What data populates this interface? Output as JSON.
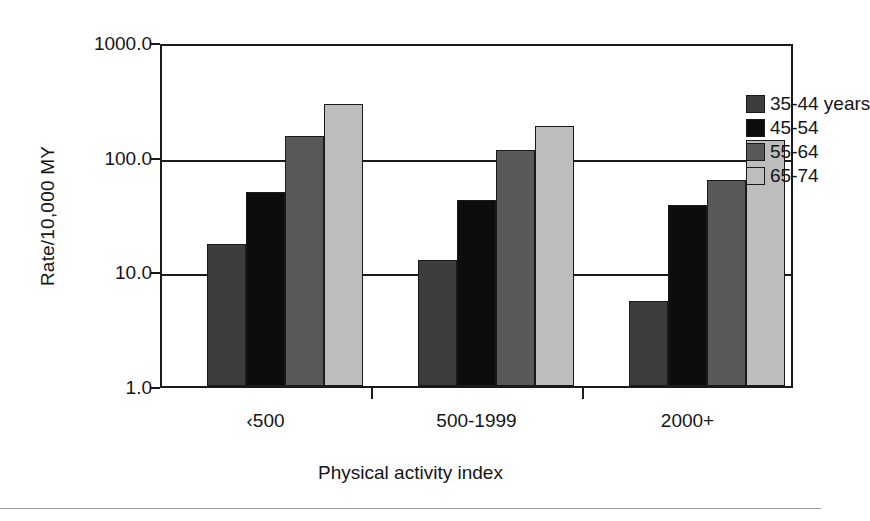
{
  "chart_data": {
    "type": "bar",
    "title": "",
    "subtitle": "",
    "xlabel": "Physical activity index",
    "ylabel": "Rate/10,000 MY",
    "yscale": "log",
    "ylim": [
      1.0,
      1000.0
    ],
    "ytick_labels": [
      "1000.0",
      "100.0",
      "10.0",
      "1.0"
    ],
    "ytick_values": [
      1000.0,
      100.0,
      10.0,
      1.0
    ],
    "grid": true,
    "grid_axis": "y",
    "legend_position": "top-right",
    "categories": [
      "‹500",
      "500-1999",
      "2000+"
    ],
    "series": [
      {
        "name": "35-44 years",
        "color": "#3d3d3d",
        "values": [
          17.3,
          12.6,
          5.5
        ]
      },
      {
        "name": "45-54",
        "color": "#0d0d0d",
        "values": [
          49.0,
          42.0,
          38.0
        ]
      },
      {
        "name": "55-64",
        "color": "#595959",
        "values": [
          152.0,
          115.0,
          62.0
        ]
      },
      {
        "name": "65-74",
        "color": "#bdbdbd",
        "values": [
          288.0,
          184.0,
          140.0
        ]
      }
    ]
  },
  "legend": {
    "items": [
      {
        "label": "35-44 years",
        "color": "#3d3d3d"
      },
      {
        "label": "45-54",
        "color": "#0d0d0d"
      },
      {
        "label": "55-64",
        "color": "#595959"
      },
      {
        "label": "65-74",
        "color": "#bdbdbd"
      }
    ]
  },
  "axes": {
    "y_title": "Rate/10,000 MY",
    "x_title": "Physical activity index",
    "y_ticks": [
      "1000.0",
      "100.0",
      "10.0",
      "1.0"
    ],
    "x_ticks": [
      "‹500",
      "500-1999",
      "2000+"
    ]
  },
  "colors": {
    "axis": "#1a1a1a",
    "background": "#ffffff",
    "text": "#151515"
  }
}
